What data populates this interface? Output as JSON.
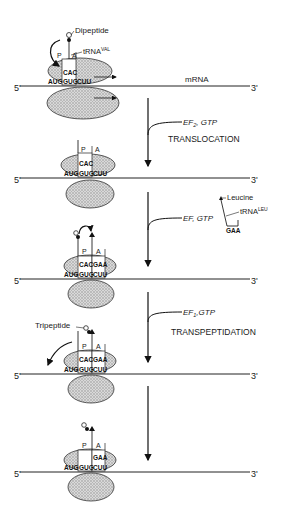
{
  "figure": {
    "mrna_label": "mRNA",
    "five_prime": "5'",
    "three_prime": "3'",
    "site_p": "P",
    "site_a": "A",
    "stages": [
      {
        "id": "stage-1",
        "peptide_label": "Dipeptide",
        "trna_label": "tRNA",
        "trna_sup": "VAL",
        "top_codon": "CAC",
        "codons": [
          "AUG",
          "GUG",
          "CUU"
        ]
      },
      {
        "id": "stage-2",
        "top_codon": "CAC",
        "codons": [
          "AUG",
          "GUG",
          "CUU"
        ]
      },
      {
        "id": "stage-3",
        "top_codons": [
          "CAC",
          "GAA"
        ],
        "codons": [
          "AUG",
          "GUG",
          "CUU"
        ]
      },
      {
        "id": "stage-4",
        "peptide_label": "Tripeptide",
        "top_codons": [
          "CAC",
          "GAA"
        ],
        "codons": [
          "AUG",
          "GUG",
          "CUU"
        ]
      },
      {
        "id": "stage-5",
        "top_codon": "GAA",
        "codons": [
          "AUG",
          "GUG",
          "CUU"
        ]
      }
    ],
    "steps": [
      {
        "factor": "EF",
        "sub": "2",
        "rest": ", GTP",
        "name": "TRANSLOCATION"
      },
      {
        "factor": "EF, GTP",
        "sub": "",
        "rest": "",
        "name": "",
        "incoming_aa": "Leucine",
        "incoming_trna": "tRNA",
        "incoming_sup": "LEU",
        "anticodon": "GAA"
      },
      {
        "factor": "EF",
        "sub": "1",
        "rest": ",GTP",
        "name": "TRANSPEPTIDATION"
      },
      {
        "factor": "",
        "sub": "",
        "rest": "",
        "name": ""
      }
    ]
  }
}
